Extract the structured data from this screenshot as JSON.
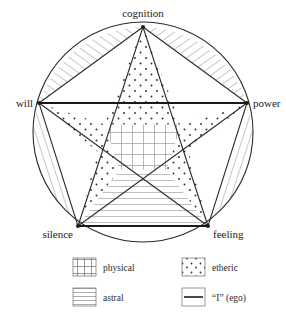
{
  "figure": {
    "background_color": "#ffffff",
    "line_color": "#2b2b2b",
    "pattern_color": "#8f8f8f"
  },
  "diagram": {
    "shape": "pentagram-in-circle",
    "circle": {
      "cx": 143,
      "cy": 132,
      "r": 110
    },
    "vertices": [
      {
        "id": "cognition",
        "label": "cognition",
        "x": 143,
        "y": 27,
        "label_x": 143,
        "label_y": 17,
        "anchor": "middle"
      },
      {
        "id": "power",
        "label": "power",
        "x": 247,
        "y": 103,
        "label_x": 253,
        "label_y": 103,
        "anchor": "start"
      },
      {
        "id": "feeling",
        "label": "feeling",
        "x": 208,
        "y": 226,
        "label_x": 214,
        "label_y": 236,
        "anchor": "start"
      },
      {
        "id": "silence",
        "label": "silence",
        "x": 78,
        "y": 226,
        "label_x": 72,
        "label_y": 236,
        "anchor": "end"
      },
      {
        "id": "will",
        "label": "will",
        "x": 39,
        "y": 103,
        "label_x": 33,
        "label_y": 103,
        "anchor": "end"
      }
    ],
    "regions": [
      {
        "id": "star-point-top",
        "fill": "etheric"
      },
      {
        "id": "star-point-left",
        "fill": "etheric"
      },
      {
        "id": "star-point-right",
        "fill": "etheric"
      },
      {
        "id": "star-point-bottom-left",
        "fill": "etheric"
      },
      {
        "id": "star-point-bottom-right",
        "fill": "etheric"
      },
      {
        "id": "inner-pentagon",
        "fill": "physical"
      },
      {
        "id": "lower-center-triangle",
        "fill": "astral"
      },
      {
        "id": "segment-upper-left",
        "fill": "astral"
      },
      {
        "id": "segment-upper-right",
        "fill": "astral"
      },
      {
        "id": "segment-lower-left",
        "fill": "astral"
      },
      {
        "id": "segment-lower-right",
        "fill": "astral"
      }
    ],
    "ego_edges": [
      {
        "id": "ego-edge-will-power",
        "from": "will",
        "to": "power"
      },
      {
        "id": "ego-edge-silence-feeling",
        "from": "silence",
        "to": "feeling"
      }
    ]
  },
  "legend": {
    "items": [
      {
        "id": "physical",
        "label": "physical",
        "pattern": "grid",
        "column": "left",
        "row": 1
      },
      {
        "id": "etheric",
        "label": "etheric",
        "pattern": "dots",
        "column": "right",
        "row": 1
      },
      {
        "id": "astral",
        "label": "astral",
        "pattern": "horizontal",
        "column": "left",
        "row": 2
      },
      {
        "id": "ego",
        "label": "“I” (ego)",
        "pattern": "solid-line",
        "column": "right",
        "row": 2
      }
    ]
  }
}
